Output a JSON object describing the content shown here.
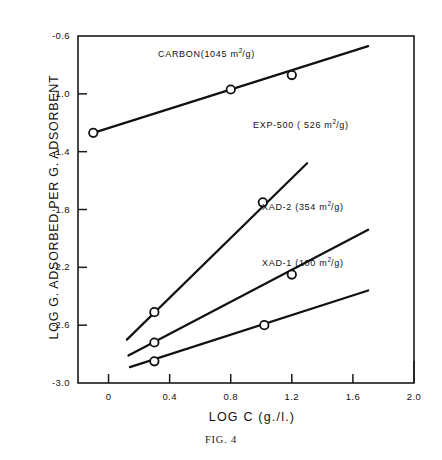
{
  "page_header": {
    "title": "",
    "page_number": ""
  },
  "figure": {
    "caption": "FIG. 4"
  },
  "chart_data": {
    "type": "line",
    "title": "",
    "xlabel": "LOG C (g./l.)",
    "ylabel": "LOG G. ADSORBED PER G. ADSORBENT",
    "xlim": [
      -0.2,
      2.0
    ],
    "ylim": [
      -3.0,
      -0.6
    ],
    "xticks": [
      0,
      0.4,
      0.8,
      1.2,
      1.6,
      2.0
    ],
    "xtick_labels": [
      "0",
      "0.4",
      "0.8",
      "1.2",
      "1.6",
      "2.0"
    ],
    "yticks": [
      -0.6,
      -1.0,
      -1.4,
      -1.8,
      -2.2,
      -2.6,
      -3.0
    ],
    "ytick_labels": [
      "-0.6",
      "-1.0",
      "-1.4",
      "-1.8",
      "-2.2",
      "-2.6",
      "-3.0"
    ],
    "grid": false,
    "legend": "inline-labels",
    "marker": "open-circle",
    "series": [
      {
        "name": "CARBON",
        "label": "CARBON(1045 m2/g)",
        "label_prefix": "CARBON(1045 m",
        "label_exp": "2",
        "label_suffix": "/g)",
        "surface_area": 1045,
        "surface_area_units": "m2/g",
        "x": [
          -0.1,
          0.8,
          1.2
        ],
        "y": [
          -1.27,
          -0.97,
          -0.87
        ],
        "line_x": [
          -0.1,
          1.7
        ],
        "line_y": [
          -1.27,
          -0.67
        ]
      },
      {
        "name": "EXP-500",
        "label": "EXP-500 ( 526 m2/g)",
        "label_prefix": "EXP-500 ( 526 m",
        "label_exp": "2",
        "label_suffix": "/g)",
        "surface_area": 526,
        "surface_area_units": "m2/g",
        "x": [
          0.3,
          1.01
        ],
        "y": [
          -2.51,
          -1.75
        ],
        "line_x": [
          0.12,
          1.3
        ],
        "line_y": [
          -2.7,
          -1.48
        ]
      },
      {
        "name": "XAD-2",
        "label": "XAD-2 (354 m2/g)",
        "label_prefix": "XAD-2 (354 m",
        "label_exp": "2",
        "label_suffix": "/g)",
        "surface_area": 354,
        "surface_area_units": "m2/g",
        "x": [
          0.3,
          1.2
        ],
        "y": [
          -2.72,
          -2.25
        ],
        "line_x": [
          0.13,
          1.7
        ],
        "line_y": [
          -2.81,
          -1.94
        ]
      },
      {
        "name": "XAD-1",
        "label": "XAD-1 (100 m2/g)",
        "label_prefix": "XAD-1 (100 m",
        "label_exp": "2",
        "label_suffix": "/g)",
        "surface_area": 100,
        "surface_area_units": "m2/g",
        "x": [
          0.3,
          1.02
        ],
        "y": [
          -2.85,
          -2.6
        ],
        "line_x": [
          0.14,
          1.7
        ],
        "line_y": [
          -2.89,
          -2.36
        ]
      }
    ]
  }
}
